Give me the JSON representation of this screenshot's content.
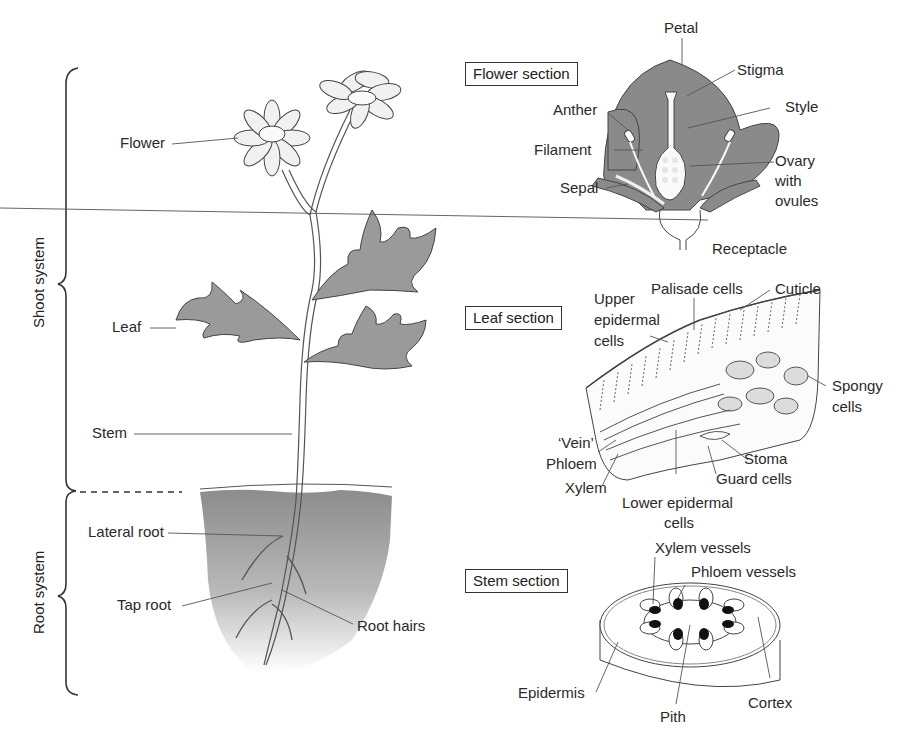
{
  "brackets": {
    "shoot_system": "Shoot system",
    "root_system": "Root system"
  },
  "plant_labels": {
    "flower": "Flower",
    "leaf": "Leaf",
    "stem": "Stem",
    "lateral_root": "Lateral root",
    "tap_root": "Tap root",
    "root_hairs": "Root hairs"
  },
  "flower_section": {
    "title": "Flower section",
    "labels": {
      "petal": "Petal",
      "stigma": "Stigma",
      "style": "Style",
      "anther": "Anther",
      "filament": "Filament",
      "ovary_line1": "Ovary",
      "ovary_line2": "with",
      "ovary_line3": "ovules",
      "sepal": "Sepal",
      "receptacle": "Receptacle"
    }
  },
  "leaf_section": {
    "title": "Leaf section",
    "labels": {
      "upper_line1": "Upper",
      "upper_line2": "epidermal",
      "upper_line3": "cells",
      "palisade": "Palisade cells",
      "cuticle": "Cuticle",
      "spongy_line1": "Spongy",
      "spongy_line2": "cells",
      "vein": "‘Vein’",
      "phloem": "Phloem",
      "xylem": "Xylem",
      "stoma": "Stoma",
      "guard_cells": "Guard cells",
      "lower_line1": "Lower epidermal",
      "lower_line2": "cells"
    }
  },
  "stem_section": {
    "title": "Stem section",
    "labels": {
      "xylem_vessels": "Xylem vessels",
      "phloem_vessels": "Phloem vessels",
      "epidermis": "Epidermis",
      "pith": "Pith",
      "cortex": "Cortex"
    }
  },
  "colors": {
    "tissue_gray": "#8a8a8a",
    "soil_gray": "#9a9a9a",
    "line": "#333333"
  }
}
